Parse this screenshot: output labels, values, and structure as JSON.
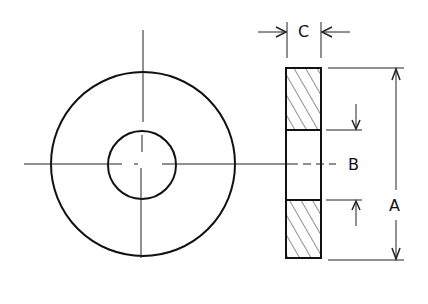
{
  "diagram": {
    "views": [
      "front view (concentric circles)",
      "side section view (hatched)"
    ],
    "labels": {
      "thickness": "C",
      "inner_diameter": "B",
      "outer_diameter": "A"
    },
    "colors": {
      "line": "#111111",
      "background": "#ffffff"
    }
  }
}
